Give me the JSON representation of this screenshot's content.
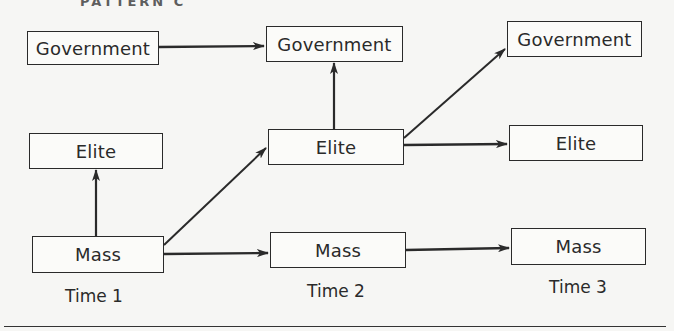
{
  "header": {
    "fragment": "PATTERN C"
  },
  "columns": [
    {
      "time_label": "Time 1",
      "government": "Government",
      "elite": "Elite",
      "mass": "Mass"
    },
    {
      "time_label": "Time 2",
      "government": "Government",
      "elite": "Elite",
      "mass": "Mass"
    },
    {
      "time_label": "Time 3",
      "government": "Government",
      "elite": "Elite",
      "mass": "Mass"
    }
  ],
  "edges": [
    {
      "from": "Government (Time 1)",
      "to": "Government (Time 2)"
    },
    {
      "from": "Mass (Time 1)",
      "to": "Elite (Time 1)"
    },
    {
      "from": "Mass (Time 1)",
      "to": "Elite (Time 2)"
    },
    {
      "from": "Mass (Time 1)",
      "to": "Mass (Time 2)"
    },
    {
      "from": "Elite (Time 2)",
      "to": "Government (Time 2)"
    },
    {
      "from": "Elite (Time 2)",
      "to": "Government (Time 3)"
    },
    {
      "from": "Elite (Time 2)",
      "to": "Elite (Time 3)"
    },
    {
      "from": "Mass (Time 2)",
      "to": "Mass (Time 3)"
    }
  ],
  "colors": {
    "ink": "#2a2a2a",
    "background": "#f6f6f4"
  }
}
